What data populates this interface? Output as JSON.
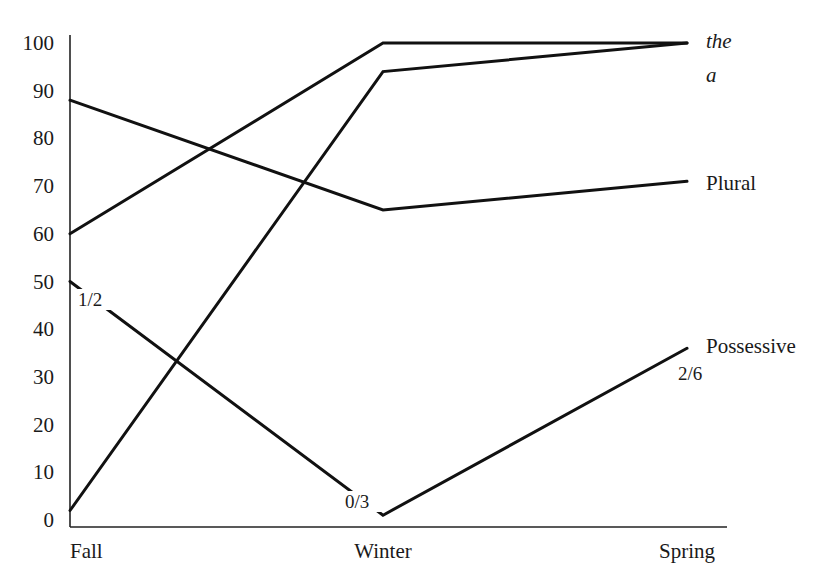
{
  "chart_data": {
    "type": "line",
    "title": "",
    "xlabel": "",
    "ylabel": "",
    "categories": [
      "Fall",
      "Winter",
      "Spring"
    ],
    "yticks": [
      "0",
      "10",
      "20",
      "30",
      "40",
      "50",
      "60",
      "70",
      "80",
      "90",
      "100"
    ],
    "ylim": [
      0,
      100
    ],
    "grid": false,
    "legend_position": "inline-right",
    "series": [
      {
        "name": "the",
        "italic": true,
        "values": [
          60,
          100,
          100
        ]
      },
      {
        "name": "a",
        "italic": true,
        "values": [
          2,
          94,
          100
        ]
      },
      {
        "name": "Plural",
        "italic": false,
        "values": [
          88,
          65,
          71
        ]
      },
      {
        "name": "Possessive",
        "italic": false,
        "values": [
          50,
          1,
          36
        ]
      }
    ],
    "annotations": [
      {
        "text": "1/2",
        "series": "Possessive",
        "at": "Fall"
      },
      {
        "text": "0/3",
        "series": "Possessive",
        "at": "Winter"
      },
      {
        "text": "2/6",
        "series": "Possessive",
        "at": "Spring"
      }
    ]
  }
}
